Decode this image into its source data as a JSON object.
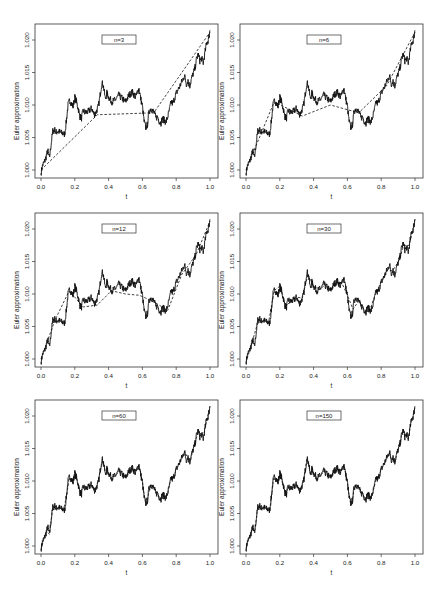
{
  "chart_data": [
    {
      "type": "line",
      "panel": "n=3",
      "label": "n=3",
      "n": 3,
      "xlabel": "t",
      "ylabel": "Euler approximation",
      "xlim": [
        0,
        1
      ],
      "ylim": [
        0.999,
        1.0215
      ],
      "xticks": [
        "0.0",
        "0.2",
        "0.4",
        "0.6",
        "0.8",
        "1.0"
      ],
      "yticks": [
        "1.000",
        "1.005",
        "1.010",
        "1.015",
        "1.020"
      ],
      "series": [
        {
          "name": "exact path (fine)",
          "style": "solid"
        },
        {
          "name": "Euler approximation n=3",
          "style": "dashed",
          "x": [
            0,
            0.333,
            0.667,
            1.0
          ],
          "y": [
            1.0,
            1.0085,
            1.0088,
            1.0212
          ]
        }
      ]
    },
    {
      "type": "line",
      "panel": "n=6",
      "label": "n=6",
      "n": 6,
      "xlabel": "t",
      "ylabel": "Euler approximation",
      "xlim": [
        0,
        1
      ],
      "ylim": [
        0.999,
        1.0215
      ],
      "xticks": [
        "0.0",
        "0.2",
        "0.4",
        "0.6",
        "0.8",
        "1.0"
      ],
      "yticks": [
        "1.000",
        "1.005",
        "1.010",
        "1.015",
        "1.020"
      ],
      "series": [
        {
          "name": "exact path (fine)",
          "style": "solid"
        },
        {
          "name": "Euler approximation n=6",
          "style": "dashed",
          "x": [
            0,
            0.167,
            0.333,
            0.5,
            0.667,
            0.833,
            1.0
          ],
          "y": [
            1.0,
            1.0105,
            1.0083,
            1.01,
            1.0088,
            1.013,
            1.0212
          ]
        }
      ]
    },
    {
      "type": "line",
      "panel": "n=12",
      "label": "n=12",
      "n": 12,
      "xlabel": "t",
      "ylabel": "Euler approximation",
      "xlim": [
        0,
        1
      ],
      "ylim": [
        0.999,
        1.0215
      ],
      "xticks": [
        "0.0",
        "0.2",
        "0.4",
        "0.6",
        "0.8",
        "1.0"
      ],
      "yticks": [
        "1.000",
        "1.005",
        "1.010",
        "1.015",
        "1.020"
      ],
      "series": [
        {
          "name": "exact path (fine)",
          "style": "solid"
        },
        {
          "name": "Euler approximation n=12",
          "style": "dashed",
          "x": [
            0,
            0.083,
            0.167,
            0.25,
            0.333,
            0.417,
            0.5,
            0.583,
            0.667,
            0.75,
            0.833,
            0.917,
            1.0
          ],
          "y": [
            1.0,
            1.006,
            1.0105,
            1.008,
            1.0083,
            1.0105,
            1.01,
            1.0098,
            1.0088,
            1.0075,
            1.013,
            1.016,
            1.0212
          ]
        }
      ]
    },
    {
      "type": "line",
      "panel": "n=30",
      "label": "n=30",
      "n": 30,
      "xlabel": "t",
      "ylabel": "Euler approximation",
      "xlim": [
        0,
        1
      ],
      "ylim": [
        0.999,
        1.0215
      ],
      "xticks": [
        "0.0",
        "0.2",
        "0.4",
        "0.6",
        "0.8",
        "1.0"
      ],
      "yticks": [
        "1.000",
        "1.005",
        "1.010",
        "1.015",
        "1.020"
      ],
      "series": [
        {
          "name": "exact path (fine)",
          "style": "solid"
        },
        {
          "name": "Euler approximation n=30",
          "style": "dashed"
        }
      ]
    },
    {
      "type": "line",
      "panel": "n=60",
      "label": "n=60",
      "n": 60,
      "xlabel": "t",
      "ylabel": "Euler approximation",
      "xlim": [
        0,
        1
      ],
      "ylim": [
        0.999,
        1.0215
      ],
      "xticks": [
        "0.0",
        "0.2",
        "0.4",
        "0.6",
        "0.8",
        "1.0"
      ],
      "yticks": [
        "1.000",
        "1.005",
        "1.010",
        "1.015",
        "1.020"
      ],
      "series": [
        {
          "name": "exact path (fine)",
          "style": "solid"
        },
        {
          "name": "Euler approximation n=60",
          "style": "dashed"
        }
      ]
    },
    {
      "type": "line",
      "panel": "n=150",
      "label": "n=150",
      "n": 150,
      "xlabel": "t",
      "ylabel": "Euler approximation",
      "xlim": [
        0,
        1
      ],
      "ylim": [
        0.999,
        1.0215
      ],
      "xticks": [
        "0.0",
        "0.2",
        "0.4",
        "0.6",
        "0.8",
        "1.0"
      ],
      "yticks": [
        "1.000",
        "1.005",
        "1.010",
        "1.015",
        "1.020"
      ],
      "series": [
        {
          "name": "exact path (fine)",
          "style": "solid"
        },
        {
          "name": "Euler approximation n=150",
          "style": "dashed"
        }
      ]
    }
  ],
  "path_keypoints": {
    "t": [
      0.0,
      0.01,
      0.02,
      0.03,
      0.04,
      0.05,
      0.06,
      0.07,
      0.08,
      0.09,
      0.1,
      0.12,
      0.14,
      0.15,
      0.16,
      0.17,
      0.18,
      0.19,
      0.2,
      0.21,
      0.22,
      0.23,
      0.24,
      0.25,
      0.26,
      0.28,
      0.3,
      0.31,
      0.32,
      0.33,
      0.34,
      0.35,
      0.36,
      0.37,
      0.38,
      0.39,
      0.4,
      0.42,
      0.44,
      0.46,
      0.48,
      0.5,
      0.52,
      0.54,
      0.56,
      0.57,
      0.58,
      0.59,
      0.6,
      0.61,
      0.62,
      0.63,
      0.64,
      0.65,
      0.66,
      0.67,
      0.68,
      0.69,
      0.7,
      0.71,
      0.72,
      0.73,
      0.74,
      0.75,
      0.76,
      0.77,
      0.78,
      0.79,
      0.8,
      0.82,
      0.84,
      0.85,
      0.86,
      0.87,
      0.88,
      0.89,
      0.9,
      0.91,
      0.92,
      0.93,
      0.94,
      0.95,
      0.96,
      0.97,
      0.98,
      0.99,
      1.0
    ],
    "y": [
      0.9995,
      1.0008,
      1.0012,
      1.002,
      1.003,
      1.0018,
      1.004,
      1.006,
      1.0062,
      1.0058,
      1.006,
      1.0057,
      1.0055,
      1.0075,
      1.01,
      1.0108,
      1.0102,
      1.0098,
      1.0112,
      1.0105,
      1.0095,
      1.0082,
      1.008,
      1.0092,
      1.0088,
      1.009,
      1.0095,
      1.0088,
      1.0085,
      1.0092,
      1.0098,
      1.0115,
      1.0135,
      1.0128,
      1.011,
      1.0118,
      1.0112,
      1.0105,
      1.0108,
      1.0115,
      1.011,
      1.0105,
      1.0115,
      1.012,
      1.0112,
      1.012,
      1.0125,
      1.011,
      1.0098,
      1.0075,
      1.0065,
      1.007,
      1.009,
      1.0095,
      1.0092,
      1.0088,
      1.008,
      1.0082,
      1.0075,
      1.0072,
      1.008,
      1.0076,
      1.0074,
      1.0082,
      1.0092,
      1.0105,
      1.0102,
      1.011,
      1.0118,
      1.0128,
      1.014,
      1.0145,
      1.0132,
      1.0138,
      1.0128,
      1.014,
      1.0148,
      1.0155,
      1.017,
      1.0178,
      1.0168,
      1.0172,
      1.0165,
      1.018,
      1.0195,
      1.02,
      1.0215
    ]
  }
}
